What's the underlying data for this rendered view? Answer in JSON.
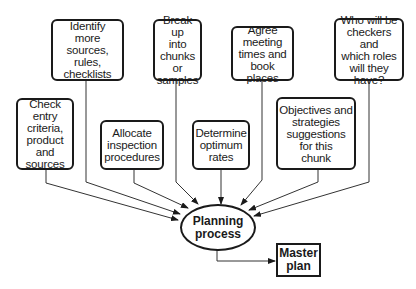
{
  "diagram": {
    "inputs": [
      {
        "id": "check-entry",
        "label": "Check entry\ncriteria,\nproduct\nand\nsources"
      },
      {
        "id": "identify-sources",
        "label": "Identify\nmore\nsources, rules,\nchecklists"
      },
      {
        "id": "allocate-procedures",
        "label": "Allocate\ninspection\nprocedures"
      },
      {
        "id": "break-up-chunks",
        "label": "Break up\ninto\nchunks\nor\nsamples"
      },
      {
        "id": "determine-rates",
        "label": "Determine\noptimum\nrates"
      },
      {
        "id": "agree-meeting",
        "label": "Agree\nmeeting\ntimes and\nbook places"
      },
      {
        "id": "objectives-strategies",
        "label": "Objectives and\nstrategies\nsuggestions\nfor this\nchunk"
      },
      {
        "id": "checkers-roles",
        "label": "Who will be\ncheckers and\nwhich roles\nwill they\nhave?"
      }
    ],
    "process": {
      "label": "Planning\nprocess"
    },
    "output": {
      "label": "Master\nplan"
    }
  }
}
